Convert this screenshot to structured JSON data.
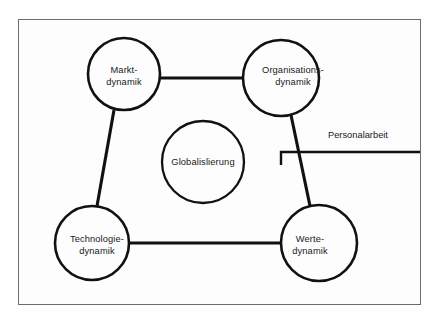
{
  "figure": {
    "background_color": "#fdfdfd",
    "frame_color": "#6b6b6b",
    "stroke_color": "#111111",
    "text_color": "#1a1a1a"
  },
  "nodes": {
    "markt": {
      "id": "markt-dynamik",
      "line1": "Markt-",
      "line2": "dynamik",
      "cx": 124,
      "cy": 74,
      "r": 36
    },
    "organisations": {
      "id": "organisations-dynamik",
      "line1": "Organisations-",
      "line2": "dynamik",
      "cx": 281,
      "cy": 78,
      "r": 38
    },
    "technologie": {
      "id": "technologie-dynamik",
      "line1": "Technologie-",
      "line2": "dynamik",
      "cx": 92,
      "cy": 243,
      "r": 37
    },
    "werte": {
      "id": "werte-dynamik",
      "line1": "Werte-",
      "line2": "dynamik",
      "cx": 319,
      "cy": 243,
      "r": 38
    },
    "globalisierung": {
      "id": "globalislierung",
      "line1": "Globalislierung",
      "line2": "",
      "cx": 203,
      "cy": 162,
      "r": 41
    }
  },
  "connectors": [
    {
      "name": "markt-to-organisations",
      "x1": 160,
      "y1": 78,
      "x2": 243,
      "y2": 78
    },
    {
      "name": "technologie-to-werte",
      "x1": 129,
      "y1": 243,
      "x2": 281,
      "y2": 243
    },
    {
      "name": "markt-to-technologie",
      "x1": 114,
      "y1": 110,
      "x2": 97,
      "y2": 206
    },
    {
      "name": "organisations-to-werte",
      "x1": 291,
      "y1": 115,
      "x2": 310,
      "y2": 206
    }
  ],
  "callout": {
    "label": "Personalarbeit",
    "leader_line": {
      "x1": 281,
      "y1": 152,
      "x2": 420,
      "y2": 152
    },
    "bracket_stub": {
      "x1": 281,
      "y1": 152,
      "x2": 281,
      "y2": 165
    }
  }
}
